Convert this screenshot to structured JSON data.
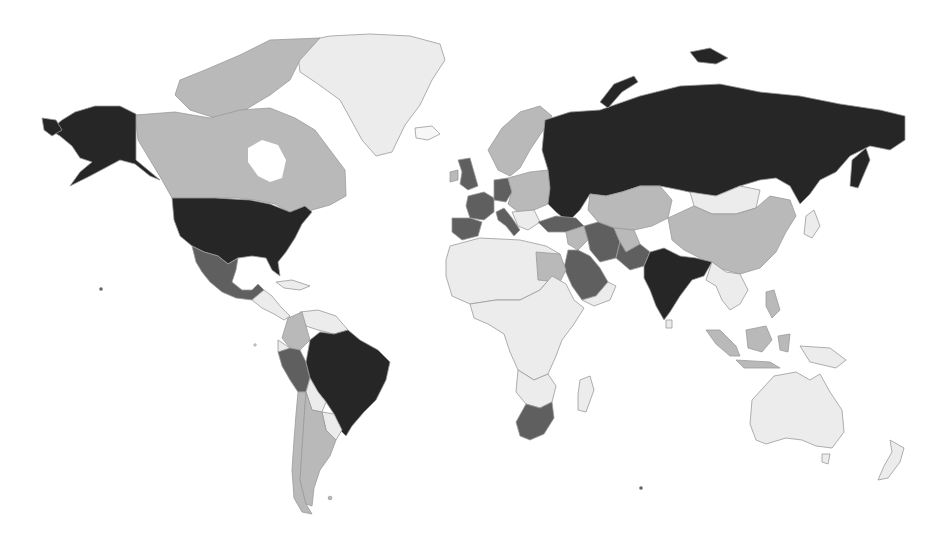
{
  "map": {
    "type": "choropleth-world-map",
    "projection": "miller-like",
    "background": "#ffffff",
    "border_color": "#9a9a9a",
    "legend": null,
    "title": null,
    "shades": {
      "level_4_darkest": "#262626",
      "level_3_dark": "#5f5f5f",
      "level_2_medium": "#b9b9b9",
      "level_1_light": "#ececec",
      "level_0_lightest": "#f7f7f7"
    },
    "countries": [
      {
        "name": "United States",
        "level": 4
      },
      {
        "name": "Alaska (US)",
        "level": 4
      },
      {
        "name": "Russia",
        "level": 4
      },
      {
        "name": "Brazil",
        "level": 4
      },
      {
        "name": "India",
        "level": 4
      },
      {
        "name": "Mexico",
        "level": 3
      },
      {
        "name": "Peru",
        "level": 3
      },
      {
        "name": "South Africa",
        "level": 3
      },
      {
        "name": "Saudi Arabia",
        "level": 3
      },
      {
        "name": "Iran",
        "level": 3
      },
      {
        "name": "Turkey",
        "level": 3
      },
      {
        "name": "Pakistan",
        "level": 3
      },
      {
        "name": "United Kingdom",
        "level": 3
      },
      {
        "name": "France",
        "level": 3
      },
      {
        "name": "Spain",
        "level": 3
      },
      {
        "name": "Italy",
        "level": 3
      },
      {
        "name": "Germany",
        "level": 3
      },
      {
        "name": "Canada",
        "level": 2
      },
      {
        "name": "China",
        "level": 2
      },
      {
        "name": "Kazakhstan",
        "level": 2
      },
      {
        "name": "Argentina",
        "level": 2
      },
      {
        "name": "Colombia",
        "level": 2
      },
      {
        "name": "Chile",
        "level": 2
      },
      {
        "name": "Egypt",
        "level": 2
      },
      {
        "name": "Indonesia",
        "level": 2
      },
      {
        "name": "Philippines",
        "level": 2
      },
      {
        "name": "Scandinavia",
        "level": 2
      },
      {
        "name": "Eastern Europe",
        "level": 2
      },
      {
        "name": "Central Asia",
        "level": 2
      },
      {
        "name": "Greenland",
        "level": 1
      },
      {
        "name": "Mongolia",
        "level": 1
      },
      {
        "name": "Australia",
        "level": 1
      },
      {
        "name": "New Zealand",
        "level": 1
      },
      {
        "name": "Africa (other)",
        "level": 1
      },
      {
        "name": "Bolivia",
        "level": 1
      },
      {
        "name": "Venezuela",
        "level": 1
      },
      {
        "name": "Central America",
        "level": 1
      },
      {
        "name": "Madagascar",
        "level": 1
      },
      {
        "name": "Southeast Asia",
        "level": 1
      },
      {
        "name": "Japan",
        "level": 1
      },
      {
        "name": "Iceland",
        "level": 0
      }
    ]
  }
}
